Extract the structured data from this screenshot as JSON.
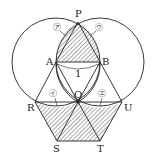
{
  "diagram": {
    "points": {
      "P": {
        "label": "P",
        "x": 78,
        "y": 22
      },
      "A": {
        "label": "A",
        "x": 56,
        "y": 62
      },
      "B": {
        "label": "B",
        "x": 100,
        "y": 62
      },
      "Q": {
        "label": "Q",
        "x": 78,
        "y": 102
      },
      "R": {
        "label": "R",
        "x": 35,
        "y": 102
      },
      "U": {
        "label": "U",
        "x": 122,
        "y": 102
      },
      "S": {
        "label": "S",
        "x": 57,
        "y": 141
      },
      "T": {
        "label": "T",
        "x": 100,
        "y": 141
      }
    },
    "length_label": "1",
    "region_labels": {
      "a": "㋐",
      "i": "㋑",
      "u": "㋒",
      "e": "㋓"
    },
    "colors": {
      "line": "#222222",
      "hatch": "#555555",
      "background": "#ffffff"
    }
  }
}
